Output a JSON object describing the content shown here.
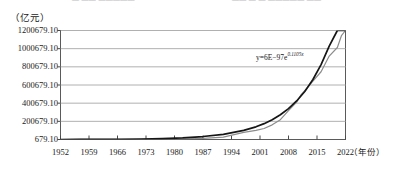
{
  "header_sliver": {
    "left_fragment": "— —— —————",
    "right_fragment": "—— — — ————— ——"
  },
  "axis_captions": {
    "y_unit": "（亿元）",
    "x_unit": "（年份）"
  },
  "annotation": {
    "equation_prefix": "y=6E",
    "equation_minus": "−",
    "equation_mid": "97e",
    "equation_exponent": "0.1105x",
    "equation_full": "y=6E−97e^0.1105x"
  },
  "colors": {
    "actual_series": "#8c8c8c",
    "fit_series": "#161616",
    "gridline": "#b0b0b0",
    "axis": "#4a4a4a",
    "background": "#ffffff"
  },
  "chart_data": {
    "type": "line",
    "title": "",
    "subtitle": "",
    "xlabel": "（年份）",
    "ylabel": "（亿元）",
    "xlim": [
      1952,
      2022
    ],
    "ylim": [
      679.1,
      1200679.1
    ],
    "grid": true,
    "grid_axis": "y",
    "legend": false,
    "legend_position": "none",
    "annotations": [
      {
        "text": "y=6E−97e^0.1105x",
        "x": 2012,
        "y": 880000
      }
    ],
    "ytick_labels": [
      "679.10",
      "200679.10",
      "400679.10",
      "600679.10",
      "800679.10",
      "1000679.10",
      "1200679.10"
    ],
    "ytick_values": [
      679.1,
      200679.1,
      400679.1,
      600679.1,
      800679.1,
      1000679.1,
      1200679.1
    ],
    "xtick_labels": [
      "1952",
      "1959",
      "1966",
      "1973",
      "1980",
      "1987",
      "1994",
      "2001",
      "2008",
      "2015",
      "2022"
    ],
    "xtick_values": [
      1952,
      1959,
      1966,
      1973,
      1980,
      1987,
      1994,
      2001,
      2008,
      2015,
      2022
    ],
    "series": [
      {
        "name": "实际值",
        "color": "#8c8c8c",
        "x": [
          1952,
          1957,
          1962,
          1967,
          1972,
          1977,
          1982,
          1987,
          1992,
          1997,
          2000,
          2002,
          2004,
          2006,
          2008,
          2010,
          2011,
          2012,
          2014,
          2016,
          2018,
          2020,
          2021,
          2022
        ],
        "values": [
          679,
          1069,
          1493,
          1774,
          2519,
          3645,
          5330,
          12059,
          27195,
          79715,
          100280,
          121717,
          161840,
          219439,
          319516,
          412119,
          487940,
          538580,
          643563,
          746395,
          919281,
          1013567,
          1143670,
          1210207
        ]
      },
      {
        "name": "拟合值",
        "color": "#161616",
        "x": [
          1952,
          1957,
          1962,
          1967,
          1972,
          1977,
          1982,
          1987,
          1992,
          1997,
          2000,
          2002,
          2004,
          2006,
          2008,
          2010,
          2012,
          2014,
          2016,
          2018,
          2020,
          2022
        ],
        "values": [
          700,
          1215,
          2110,
          3665,
          6366,
          11058,
          19210,
          33370,
          57968,
          100690,
          140390,
          175190,
          218600,
          272770,
          340360,
          424680,
          529900,
          661200,
          825000,
          1029400,
          1284500,
          1602800
        ]
      }
    ]
  }
}
